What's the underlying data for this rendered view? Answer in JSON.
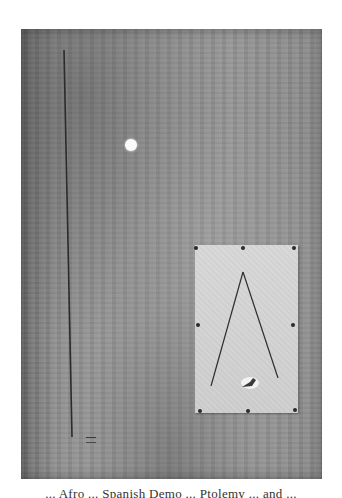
{
  "artwork": {
    "canvas_color": "#8f8f8f",
    "paper_color": "#d4d4d4",
    "line_color": "#2b2b2b",
    "dot_color": "#fbfbfb",
    "elements": {
      "vertical_line": "thin dark vertical line on left",
      "white_dot": "small white circle",
      "pinned_paper": "light rectangle pinned with 8 pins",
      "inverted_v": "two thin lines forming an A shape",
      "splotch": "small dark and white mark",
      "signature": "small mark near lower left"
    }
  },
  "caption": {
    "text": "... Afro ... Spanish Demo ... Ptolemy ... and ..."
  }
}
